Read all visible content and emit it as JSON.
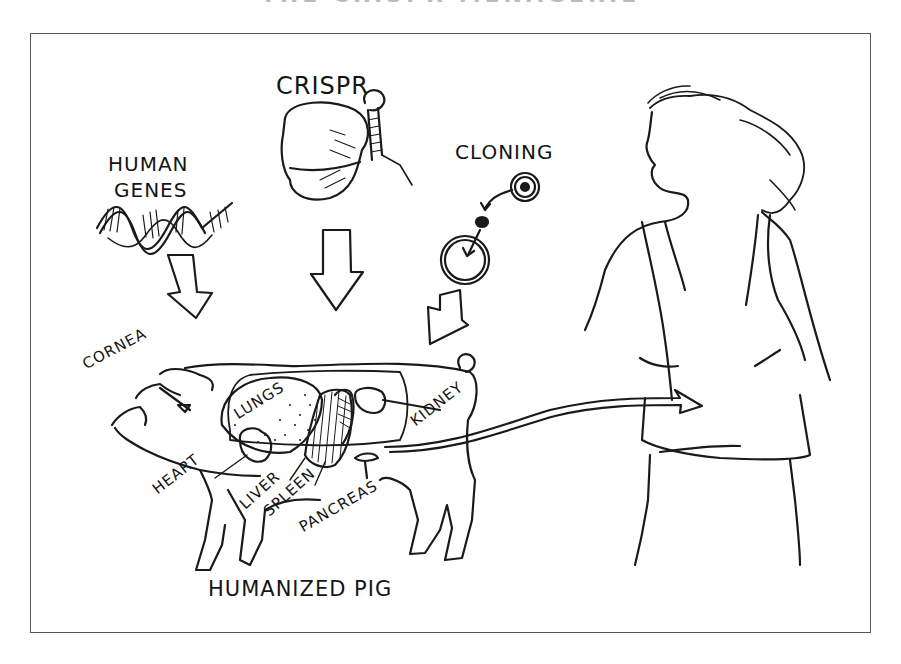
{
  "figure": {
    "top_title_partial": "THE CRISPR MENAGERIE",
    "stroke_color": "#1a1a1a",
    "frame_color": "#555555"
  },
  "inputs": [
    {
      "id": "human_genes",
      "label_line1": "HUMAN",
      "label_line2": "GENES",
      "icon": "dna-double-helix-icon"
    },
    {
      "id": "crispr",
      "label": "CRISPR",
      "icon": "cas9-protein-with-guide-rna-icon"
    },
    {
      "id": "cloning",
      "label": "CLONING",
      "icon": "nuclear-transfer-cells-icon"
    }
  ],
  "pig": {
    "caption": "HUMANIZED PIG",
    "organs": [
      "CORNEA",
      "LUNGS",
      "KIDNEY",
      "HEART",
      "LIVER",
      "SPLEEN",
      "PANCREAS"
    ]
  },
  "recipient": {
    "description": "woman-figure"
  }
}
